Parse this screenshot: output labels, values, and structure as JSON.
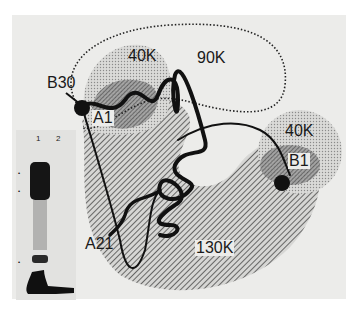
{
  "figure": {
    "domains": [
      {
        "id": "domain-40k-a",
        "label": "40K"
      },
      {
        "id": "domain-90k",
        "label": "90K"
      },
      {
        "id": "domain-40k-b",
        "label": "40K"
      },
      {
        "id": "domain-130k",
        "label": "130K"
      }
    ],
    "residues": [
      {
        "id": "b30",
        "label": "B30"
      },
      {
        "id": "a1",
        "label": "A1"
      },
      {
        "id": "b1",
        "label": "B1"
      },
      {
        "id": "a21",
        "label": "A21"
      }
    ],
    "gel": {
      "lanes": [
        "1",
        "2"
      ],
      "markers": [
        "•",
        "•",
        "•"
      ]
    }
  }
}
